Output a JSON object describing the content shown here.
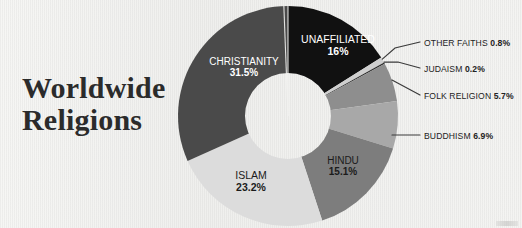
{
  "title": {
    "line1": "Worldwide",
    "line2": "Religions"
  },
  "colors": {
    "background": "#f2f2f0",
    "title_text": "#2b2b2b",
    "christianity": "#4a4a4a",
    "unaffiliated": "#111111",
    "other_faiths": "#cfcfcf",
    "judaism": "#2e2e2e",
    "folk_religion": "#8e8e8e",
    "buddhism": "#a8a8a8",
    "hindu": "#7d7d7d",
    "islam": "#dcdcdc",
    "leader_line": "#3a3a3a",
    "label_light": "#ffffff",
    "label_dark": "#1b1b1b"
  },
  "chart_data": {
    "type": "pie",
    "title": "Worldwide Religions",
    "subtype": "donut",
    "categories": [
      "Unaffiliated",
      "Other Faiths",
      "Judaism",
      "Folk Religion",
      "Buddhism",
      "Hindu",
      "Islam",
      "Christianity"
    ],
    "values": [
      16,
      0.8,
      0.2,
      5.7,
      6.9,
      15.1,
      23.2,
      31.5
    ],
    "value_labels": [
      "16%",
      "0.8%",
      "0.2%",
      "5.7%",
      "6.9%",
      "15.1%",
      "23.2%",
      "31.5%"
    ],
    "colors": [
      "#111111",
      "#cfcfcf",
      "#2e2e2e",
      "#8e8e8e",
      "#a8a8a8",
      "#7d7d7d",
      "#dcdcdc",
      "#4a4a4a"
    ],
    "start_angle_deg": 0,
    "direction": "clockwise",
    "inner_radius_ratio": 0.39,
    "legend": "none",
    "grid": false,
    "label_placement": [
      "inside",
      "callout",
      "callout",
      "callout",
      "callout",
      "inside",
      "inside",
      "inside"
    ]
  },
  "slice_labels": {
    "christianity": {
      "name": "CHRISTIANITY",
      "percent": "31.5%"
    },
    "unaffiliated": {
      "name": "UNAFFILIATED",
      "percent": "16%"
    },
    "hindu": {
      "name": "HINDU",
      "percent": "15.1%"
    },
    "islam": {
      "name": "ISLAM",
      "percent": "23.2%"
    }
  },
  "callouts": {
    "other_faiths": {
      "name": "OTHER FAITHS",
      "percent": "0.8%"
    },
    "judaism": {
      "name": "JUDAISM",
      "percent": "0.2%"
    },
    "folk_religion": {
      "name": "FOLK RELIGION",
      "percent": "5.7%"
    },
    "buddhism": {
      "name": "BUDDHISM",
      "percent": "6.9%"
    }
  }
}
